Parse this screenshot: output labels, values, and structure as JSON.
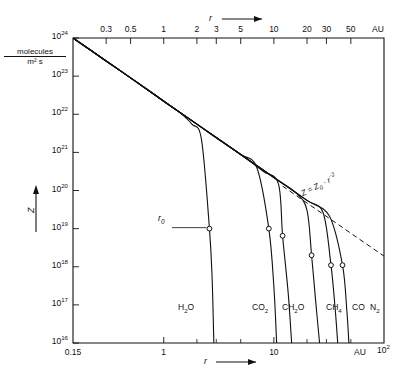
{
  "figure": {
    "title": "",
    "y_unit_numerator": "molecules",
    "y_unit_denominator": "m² s",
    "y_axis_symbol": "Z",
    "x_axis_symbol": "r",
    "x_axis_symbol_bottom": "r",
    "au_label_top": "AU",
    "au_label_bottom": "AU",
    "power_law_annotation": "Z = Z₀ · r⁻²",
    "r0_label": "r₀"
  },
  "chart_data": {
    "type": "line",
    "xlabel": "r",
    "ylabel": "Z",
    "x_unit": "AU",
    "y_unit": "molecules / m² s",
    "xscale": "log",
    "yscale": "log",
    "xlim": [
      0.15,
      100
    ],
    "ylim": [
      1e+16,
      1e+24
    ],
    "grid": false,
    "legend": "inline-curve-labels",
    "x_ticks_top": [
      "0.3",
      "0.5",
      "1",
      "2",
      "3",
      "5",
      "10",
      "20",
      "30",
      "50",
      "AU"
    ],
    "x_tick_values_top": [
      0.3,
      0.5,
      1,
      2,
      3,
      5,
      10,
      20,
      30,
      50
    ],
    "x_ticks_bottom": [
      "0.15",
      "1",
      "10",
      "AU",
      "10²"
    ],
    "x_tick_values_bottom": [
      0.15,
      1,
      10,
      100
    ],
    "y_ticks": [
      "10²⁴",
      "10²³",
      "10²²",
      "10²¹",
      "10²⁰",
      "10¹⁹",
      "10¹⁸",
      "10¹⁷",
      "10¹⁶"
    ],
    "y_tick_exponents": [
      24,
      23,
      22,
      21,
      20,
      19,
      18,
      17,
      16
    ],
    "annotations": [
      {
        "text": "Z = Z₀ · r⁻²",
        "x": 16,
        "y": 2.5e+19,
        "kind": "power-law-asymptote"
      },
      {
        "text": "r₀",
        "x": 1.6,
        "y": 1.1e+19,
        "kind": "knee-marker-callout"
      }
    ],
    "series": [
      {
        "name": "H₂O",
        "label": "H₂O",
        "knee_r": 2.6,
        "knee_Z": 1e+19,
        "marker": "open-circle",
        "points": [
          [
            0.15,
            1e+24
          ],
          [
            0.2,
            5.6e+23
          ],
          [
            0.3,
            2.5e+23
          ],
          [
            0.5,
            9e+22
          ],
          [
            0.7,
            4.6e+22
          ],
          [
            1.0,
            2.2e+22
          ],
          [
            1.4,
            1.1e+22
          ],
          [
            1.8,
            5.5e+21
          ],
          [
            2.2,
            2.2e+21
          ],
          [
            2.6,
            1e+19
          ],
          [
            2.75,
            5e+17
          ],
          [
            2.85,
            1e+16
          ]
        ]
      },
      {
        "name": "CO₂",
        "label": "CO₂",
        "knee_r": 9.0,
        "knee_Z": 1e+19,
        "marker": "open-circle",
        "points": [
          [
            0.15,
            1e+24
          ],
          [
            0.3,
            2.5e+23
          ],
          [
            0.5,
            9e+22
          ],
          [
            1.0,
            2.2e+22
          ],
          [
            2.0,
            5.5e+21
          ],
          [
            3.0,
            2.4e+21
          ],
          [
            5.0,
            8.8e+20
          ],
          [
            7.0,
            4e+20
          ],
          [
            9.0,
            1e+19
          ],
          [
            10.0,
            3e+17
          ],
          [
            10.6,
            1e+16
          ]
        ]
      },
      {
        "name": "CH₂O",
        "label": "CH₂O",
        "knee_r": 12.0,
        "knee_Z": 6.5e+18,
        "marker": "open-circle",
        "points": [
          [
            0.15,
            1e+24
          ],
          [
            0.3,
            2.5e+23
          ],
          [
            0.5,
            9e+22
          ],
          [
            1.0,
            2.2e+22
          ],
          [
            2.0,
            5.5e+21
          ],
          [
            3.0,
            2.4e+21
          ],
          [
            5.0,
            8.8e+20
          ],
          [
            8.0,
            3.2e+20
          ],
          [
            11.0,
            1.5e+20
          ],
          [
            12.0,
            6.5e+18
          ],
          [
            13.5,
            2e+17
          ],
          [
            14.5,
            1e+16
          ]
        ]
      },
      {
        "name": "CH₄",
        "label": "CH₄",
        "knee_r": 22.0,
        "knee_Z": 2e+18,
        "marker": "open-circle",
        "points": [
          [
            0.15,
            1e+24
          ],
          [
            0.3,
            2.5e+23
          ],
          [
            0.5,
            9e+22
          ],
          [
            1.0,
            2.2e+22
          ],
          [
            2.0,
            5.5e+21
          ],
          [
            5.0,
            8.8e+20
          ],
          [
            10.0,
            2.2e+20
          ],
          [
            16.0,
            8.5e+19
          ],
          [
            20.0,
            3e+19
          ],
          [
            22.0,
            2e+18
          ],
          [
            24.0,
            1.2e+17
          ],
          [
            26.0,
            1e+16
          ]
        ]
      },
      {
        "name": "CO",
        "label": "CO",
        "knee_r": 33.0,
        "knee_Z": 1.1e+18,
        "marker": "open-circle",
        "points": [
          [
            0.15,
            1e+24
          ],
          [
            0.3,
            2.5e+23
          ],
          [
            0.5,
            9e+22
          ],
          [
            1.0,
            2.2e+22
          ],
          [
            2.0,
            5.5e+21
          ],
          [
            5.0,
            8.8e+20
          ],
          [
            10.0,
            2.2e+20
          ],
          [
            20.0,
            5.5e+19
          ],
          [
            28.0,
            2.6e+19
          ],
          [
            33.0,
            1.1e+18
          ],
          [
            36.0,
            8e+16
          ],
          [
            38.0,
            1e+16
          ]
        ]
      },
      {
        "name": "N₂",
        "label": "N₂",
        "knee_r": 42.0,
        "knee_Z": 1.1e+18,
        "marker": "open-circle",
        "points": [
          [
            0.15,
            1e+24
          ],
          [
            0.3,
            2.5e+23
          ],
          [
            0.5,
            9e+22
          ],
          [
            1.0,
            2.2e+22
          ],
          [
            2.0,
            5.5e+21
          ],
          [
            5.0,
            8.8e+20
          ],
          [
            10.0,
            2.2e+20
          ],
          [
            20.0,
            5.5e+19
          ],
          [
            32.0,
            2.1e+19
          ],
          [
            42.0,
            1.1e+18
          ],
          [
            46.0,
            7e+16
          ],
          [
            48.0,
            1e+16
          ]
        ]
      }
    ],
    "asymptote": {
      "name": "Z = Z₀ · r⁻²",
      "style": "dashed",
      "slope": -2,
      "points": [
        [
          12.0,
          1.3e+20
        ],
        [
          100.0,
          1.9e+18
        ]
      ]
    }
  }
}
